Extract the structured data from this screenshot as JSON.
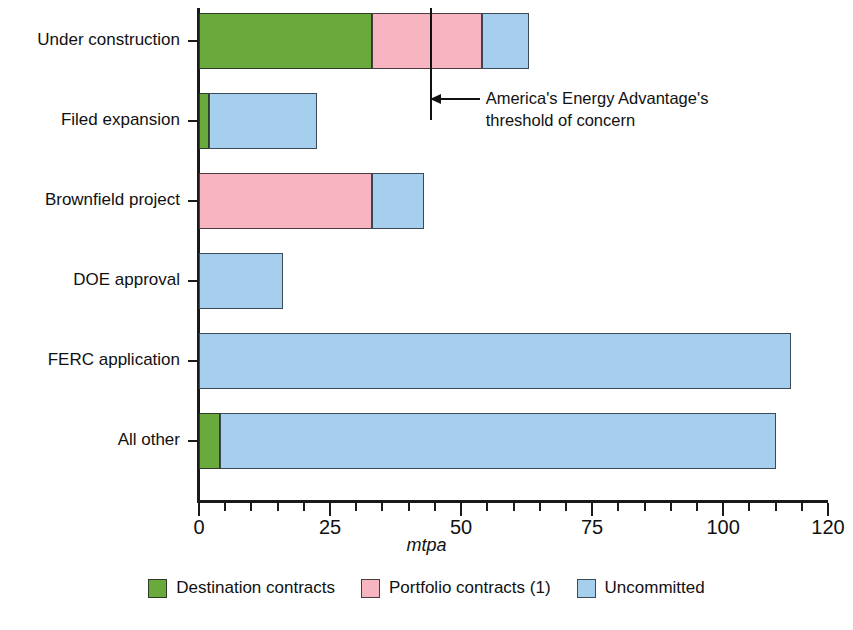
{
  "chart_data": {
    "type": "bar",
    "orientation": "horizontal",
    "stacked": true,
    "title": "",
    "xlabel": "mtpa",
    "ylabel": "",
    "xlim": [
      0,
      120
    ],
    "xticks": [
      0,
      25,
      50,
      75,
      100,
      120
    ],
    "xtick_labels": [
      "0",
      "25",
      "50",
      "75",
      "100",
      "120"
    ],
    "minor_tick_step": 5,
    "grid": false,
    "legend_position": "bottom",
    "categories": [
      "Under construction",
      "Filed expansion",
      "Brownfield project",
      "DOE approval",
      "FERC application",
      "All other"
    ],
    "series": [
      {
        "name": "Destination contracts",
        "color": "#6aaa3c",
        "values": [
          33,
          2,
          0,
          0,
          0,
          4
        ]
      },
      {
        "name": "Portfolio contracts (1)",
        "color": "#f6b5c0",
        "values": [
          21,
          0,
          33,
          0,
          0,
          0
        ]
      },
      {
        "name": "Uncommitted",
        "color": "#a6cfee",
        "values": [
          9,
          20.5,
          10,
          16,
          113,
          106
        ]
      }
    ],
    "totals": [
      63,
      22.5,
      43,
      16,
      113,
      110
    ],
    "annotations": [
      {
        "type": "threshold-line",
        "value": 44,
        "label_line1": "America's Energy Advantage's",
        "label_line2": "threshold of concern"
      }
    ]
  },
  "axis": {
    "x_title": "mtpa"
  },
  "legend": {
    "items": [
      {
        "label": "Destination contracts",
        "swatch": "green"
      },
      {
        "label": "Portfolio contracts (1)",
        "swatch": "pink"
      },
      {
        "label": "Uncommitted",
        "swatch": "blue"
      }
    ]
  }
}
